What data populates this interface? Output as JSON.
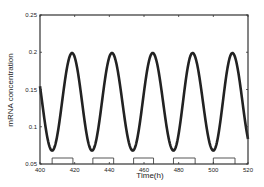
{
  "chart_data": {
    "type": "line",
    "title": "",
    "xlabel": "Time(h)",
    "ylabel": "mRNA concentration",
    "xlim": [
      400,
      520
    ],
    "ylim": [
      0.05,
      0.25
    ],
    "xticks": [
      400,
      420,
      440,
      460,
      480,
      500,
      520
    ],
    "xtick_labels": [
      "400",
      "420",
      "440",
      "460",
      "480",
      "500",
      "520"
    ],
    "yticks": [
      0.05,
      0.1,
      0.15,
      0.2,
      0.25
    ],
    "ytick_labels": [
      "0.05",
      "0.1",
      "0.15",
      "0.2",
      "0.25"
    ],
    "grid": false,
    "legend": null,
    "series": [
      {
        "name": "mRNA concentration",
        "color": "#222222",
        "period_h": 23.2,
        "min": 0.068,
        "max": 0.199,
        "peaks_x": [
          418.5,
          441.5,
          465,
          488,
          511
        ],
        "troughs_x": [
          407,
          430,
          453.5,
          477,
          500
        ],
        "x": [
          400,
          404,
          407,
          410,
          414,
          418.5,
          422,
          426,
          430,
          434,
          438,
          441.5,
          445,
          449,
          453.5,
          457,
          461,
          465,
          469,
          473,
          477,
          481,
          485,
          488,
          492,
          496,
          500,
          504,
          508,
          511,
          515,
          520
        ],
        "y": [
          0.103,
          0.076,
          0.068,
          0.084,
          0.152,
          0.199,
          0.172,
          0.106,
          0.068,
          0.09,
          0.16,
          0.199,
          0.172,
          0.108,
          0.068,
          0.09,
          0.16,
          0.199,
          0.168,
          0.104,
          0.068,
          0.092,
          0.162,
          0.199,
          0.168,
          0.104,
          0.068,
          0.092,
          0.162,
          0.199,
          0.168,
          0.105
        ]
      }
    ],
    "annotations": {
      "light_dark_bars": [
        {
          "start": 407,
          "end": 419
        },
        {
          "start": 430.5,
          "end": 442.5
        },
        {
          "start": 454,
          "end": 465.5
        },
        {
          "start": 477,
          "end": 489.5
        },
        {
          "start": 500,
          "end": 512.5
        }
      ]
    }
  }
}
